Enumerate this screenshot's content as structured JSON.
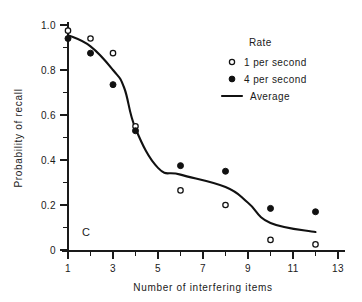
{
  "figure": {
    "panel_label": "C",
    "background_color": "#ffffff",
    "ink_color": "#111111"
  },
  "axes": {
    "x_title": "Number of interfering items",
    "y_title": "Probability of recall",
    "x_ticks": [
      "1",
      "3",
      "5",
      "7",
      "9",
      "11",
      "13"
    ],
    "y_ticks": [
      "0",
      "0.2",
      "0.4",
      "0.6",
      "0.8",
      "1.0"
    ]
  },
  "legend": {
    "title": "Rate",
    "entries": [
      {
        "label": "1 per second",
        "marker": "open-circle-icon"
      },
      {
        "label": "4 per second",
        "marker": "filled-circle-icon"
      },
      {
        "label": "Average",
        "marker": "line-segment-icon"
      }
    ]
  },
  "chart_data": {
    "type": "scatter",
    "title": "",
    "subtitle": "",
    "xlabel": "Number of interfering items",
    "ylabel": "Probability of recall",
    "xlim": [
      0.4,
      13.6
    ],
    "ylim": [
      0,
      1.0
    ],
    "x_ticks_major": [
      1,
      3,
      5,
      7,
      9,
      11,
      13
    ],
    "x_ticks_minor": [
      2,
      4,
      6,
      8,
      10,
      12
    ],
    "y_ticks_major": [
      0,
      0.2,
      0.4,
      0.6,
      0.8,
      1.0
    ],
    "y_ticks_minor": [
      0.1,
      0.3,
      0.5,
      0.7,
      0.9
    ],
    "grid": false,
    "legend_position": "upper-right",
    "annotations": [
      {
        "text": "C",
        "x": 1.6,
        "y": 0.08
      }
    ],
    "series": [
      {
        "name": "1 per second",
        "marker": "open-circle",
        "style": "points",
        "x": [
          1,
          2,
          3,
          4,
          6,
          8,
          10,
          12
        ],
        "values": [
          0.975,
          0.94,
          0.875,
          0.55,
          0.265,
          0.2,
          0.045,
          0.025
        ]
      },
      {
        "name": "4 per second",
        "marker": "filled-circle",
        "style": "points",
        "x": [
          1,
          2,
          3,
          4,
          6,
          8,
          10,
          12
        ],
        "values": [
          0.94,
          0.875,
          0.735,
          0.53,
          0.375,
          0.35,
          0.185,
          0.17
        ]
      },
      {
        "name": "Average",
        "marker": "none",
        "style": "line",
        "x": [
          1,
          2,
          3,
          3.5,
          4,
          5,
          6,
          8,
          9,
          10,
          12
        ],
        "values": [
          0.955,
          0.905,
          0.8,
          0.72,
          0.54,
          0.365,
          0.335,
          0.28,
          0.21,
          0.12,
          0.08
        ]
      }
    ]
  }
}
